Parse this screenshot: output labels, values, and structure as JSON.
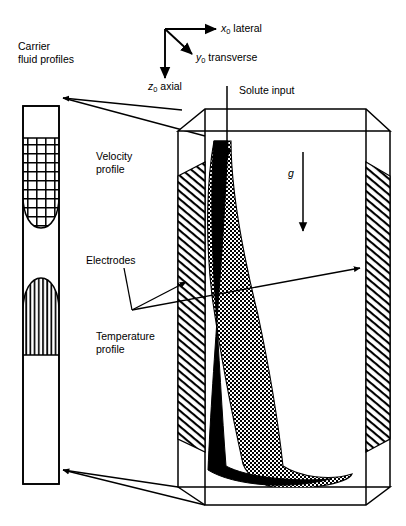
{
  "figure": {
    "title_none": "",
    "axes": {
      "x": {
        "symbol": "x",
        "subscript": "0",
        "name": "lateral",
        "icon": "arrow-right-icon"
      },
      "y": {
        "symbol": "y",
        "subscript": "0",
        "name": "transverse",
        "icon": "arrow-diagonal-icon"
      },
      "z": {
        "symbol": "z",
        "subscript": "0",
        "name": "axial",
        "icon": "arrow-down-icon"
      }
    },
    "left_panel": {
      "caption": "Carrier\nfluid profiles",
      "velocity_label": "Velocity\nprofile",
      "temperature_label": "Temperature\nprofile",
      "velocity_fill": "grid-hatch",
      "temperature_fill": "vertical-hatch"
    },
    "channel": {
      "solute_input_label": "Solute input",
      "gravity_label": "g",
      "electrodes_label": "Electrodes",
      "electrode_fill": "diagonal-hatch",
      "plume_core_fill": "solid-black",
      "plume_shell_fill": "checker-hatch"
    },
    "colors": {
      "ink": "#000000",
      "paper": "#ffffff",
      "line": "#1a1a1a"
    }
  }
}
